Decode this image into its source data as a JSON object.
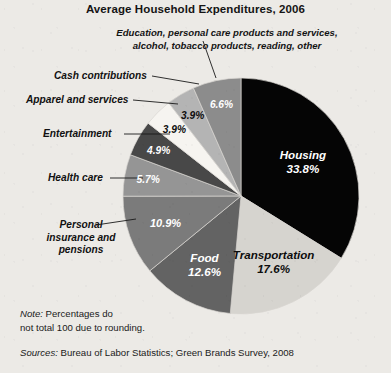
{
  "header": {
    "title": "Average Household Expenditures, 2006"
  },
  "callout": {
    "education_line1": "Education, personal care products and services,",
    "education_line2": "alcohol, tobacco products, reading, other"
  },
  "labels": {
    "cash_contributions": "Cash contributions",
    "apparel_and_services": "Apparel and services",
    "entertainment": "Entertainment",
    "health_care": "Health care",
    "personal_insurance_line1": "Personal",
    "personal_insurance_line2": "insurance and",
    "personal_insurance_line3": "pensions"
  },
  "footnotes": {
    "note_prefix": "Note:",
    "note_line1": " Percentages do",
    "note_line2": "not total 100 due to rounding.",
    "sources_prefix": "Sources:",
    "sources_text": " Bureau of Labor Statistics; Green Brands Survey, 2008"
  },
  "chart_data": {
    "type": "pie",
    "title": "Average Household Expenditures, 2006",
    "unit": "percent",
    "total_note": "Percentages do not total 100 due to rounding.",
    "legend": "none (direct labels with leader lines)",
    "categories": [
      "Housing",
      "Transportation",
      "Food",
      "Personal insurance and pensions",
      "Health care",
      "Entertainment",
      "Apparel and services",
      "Cash contributions",
      "Education, personal care products and services, alcohol, tobacco products, reading, other"
    ],
    "values": [
      33.8,
      17.6,
      12.6,
      10.9,
      5.7,
      4.9,
      3.9,
      3.9,
      6.6
    ],
    "value_labels": [
      "33.8%",
      "17.6%",
      "12.6%",
      "10.9%",
      "5.7%",
      "4.9%",
      "3.9%",
      "3.9%",
      "6.6%"
    ],
    "colors": [
      "#050505",
      "#d6d4cf",
      "#636363",
      "#7b7b7b",
      "#959595",
      "#484848",
      "#f6f4f0",
      "#b4b4b4",
      "#8c8c8c"
    ],
    "label_text_colors": [
      "#ffffff",
      "#0d0d0d",
      "#ffffff",
      "#ffffff",
      "#ffffff",
      "#ffffff",
      "#0d0d0d",
      "#0d0d0d",
      "#ffffff"
    ],
    "inline_labeled_slices": [
      "Housing",
      "Transportation",
      "Food"
    ],
    "start_angle_deg": 0,
    "direction": "clockwise",
    "sum_of_values": 99.9
  }
}
